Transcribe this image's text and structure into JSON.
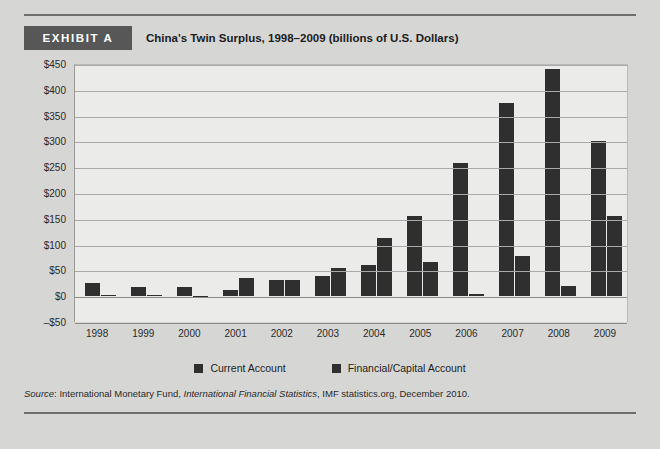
{
  "header": {
    "exhibit_label": "EXHIBIT A",
    "title": "China's Twin Surplus, 1998–2009 (billions of U.S. Dollars)"
  },
  "source": {
    "prefix": "Source",
    "separator": ": ",
    "publisher": "International Monetary Fund, ",
    "publication": "International Financial Statistics",
    "suffix": ", IMF statistics.org, December 2010."
  },
  "colors": {
    "page_background": "#d6d6d4",
    "plot_background": "#ebebe9",
    "bar": "#2f2f2f",
    "badge": "#575757",
    "gridline": "#a9a9a9",
    "rule": "#6e6e6e"
  },
  "chart_data": {
    "type": "bar",
    "title": "China's Twin Surplus, 1998–2009 (billions of U.S. Dollars)",
    "xlabel": "",
    "ylabel": "",
    "ylim": [
      -50,
      450
    ],
    "ytick_step": 50,
    "ytick_labels": [
      "$450",
      "$400",
      "$350",
      "$300",
      "$250",
      "$200",
      "$150",
      "$100",
      "$50",
      "$0",
      "–$50"
    ],
    "ytick_values": [
      450,
      400,
      350,
      300,
      250,
      200,
      150,
      100,
      50,
      0,
      -50
    ],
    "grid": true,
    "legend_position": "bottom",
    "categories": [
      "1998",
      "1999",
      "2000",
      "2001",
      "2002",
      "2003",
      "2004",
      "2005",
      "2006",
      "2007",
      "2008",
      "2009"
    ],
    "series": [
      {
        "name": "Current Account",
        "values": [
          25,
          17,
          18,
          12,
          32,
          40,
          60,
          155,
          258,
          375,
          440,
          300
        ]
      },
      {
        "name": "Financial/Capital Account",
        "values": [
          0,
          0,
          -2,
          35,
          32,
          55,
          113,
          67,
          5,
          78,
          20,
          155
        ]
      }
    ]
  }
}
